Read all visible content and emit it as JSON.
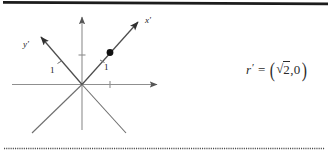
{
  "figure": {
    "kind": "coordinate-axes-diagram",
    "origin_label": "O",
    "axes": [
      {
        "name": "x-axis",
        "label": "",
        "orientation": "horizontal-right"
      },
      {
        "name": "y-axis",
        "label": "",
        "orientation": "vertical-up"
      },
      {
        "name": "x-prime-axis",
        "label": "x'",
        "orientation": "diagonal-up-right-45"
      },
      {
        "name": "y-prime-axis",
        "label": "y'",
        "orientation": "diagonal-up-left-45"
      }
    ],
    "tick_labels": {
      "x_prime_one": "1",
      "y_prime_one": "1"
    },
    "point": {
      "name": "plotted-point",
      "description": "filled dot on the x' axis at unit distance"
    }
  },
  "equation": {
    "lhs_variable": "r",
    "lhs_prime": "′",
    "equals": "=",
    "open_paren": "(",
    "radical_sign": "√",
    "radicand": "2",
    "comma": ",",
    "second_component": "0",
    "close_paren": ")",
    "plain_text": "r' = (√2, 0)"
  },
  "rules": {
    "top_rule_name": "top-divider",
    "bottom_rule_name": "bottom-dotted-divider"
  },
  "colors": {
    "ink": "#1a1a1a",
    "axis_gray": "#8a8a8a",
    "diagonal_gray": "#6e6e6e",
    "background": "#ffffff"
  }
}
